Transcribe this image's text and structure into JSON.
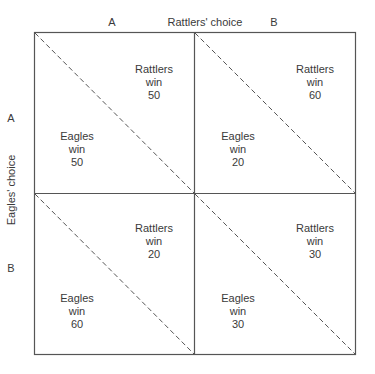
{
  "diagram": {
    "column_title": "Rattlers' choice",
    "row_title": "Eagles' choice",
    "columns": [
      "A",
      "B"
    ],
    "rows": [
      "A",
      "B"
    ],
    "cells": [
      {
        "row": "A",
        "col": "A",
        "rattlers": {
          "name": "Rattlers",
          "verb": "win",
          "value": "50"
        },
        "eagles": {
          "name": "Eagles",
          "verb": "win",
          "value": "50"
        }
      },
      {
        "row": "A",
        "col": "B",
        "rattlers": {
          "name": "Rattlers",
          "verb": "win",
          "value": "60"
        },
        "eagles": {
          "name": "Eagles",
          "verb": "win",
          "value": "20"
        }
      },
      {
        "row": "B",
        "col": "A",
        "rattlers": {
          "name": "Rattlers",
          "verb": "win",
          "value": "20"
        },
        "eagles": {
          "name": "Eagles",
          "verb": "win",
          "value": "60"
        }
      },
      {
        "row": "B",
        "col": "B",
        "rattlers": {
          "name": "Rattlers",
          "verb": "win",
          "value": "30"
        },
        "eagles": {
          "name": "Eagles",
          "verb": "win",
          "value": "30"
        }
      }
    ],
    "colors": {
      "line": "#555555",
      "text": "#3a3a3a"
    }
  }
}
